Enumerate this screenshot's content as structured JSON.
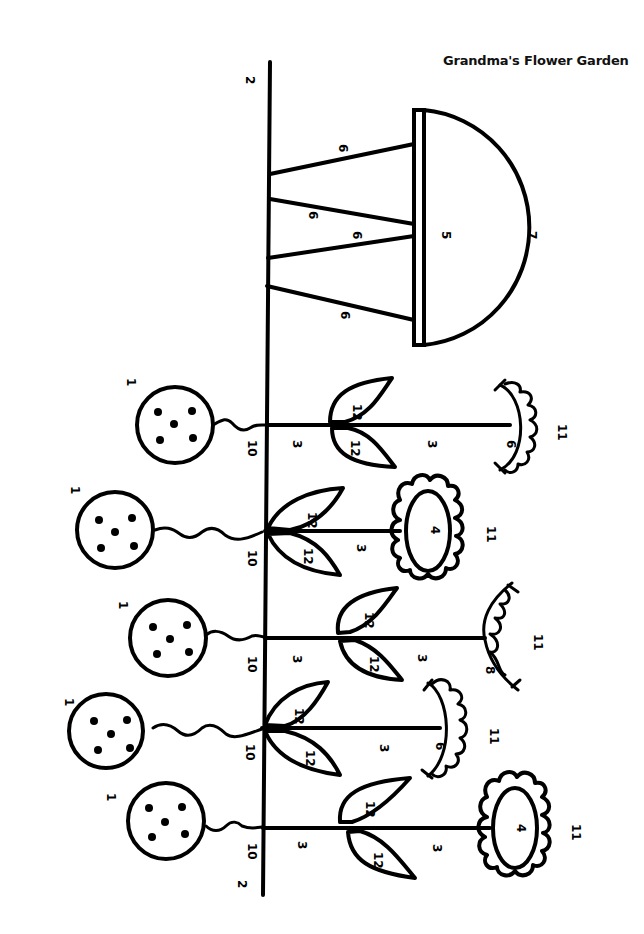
{
  "title": "Grandma's Flower Garden",
  "colors": {
    "ink": "#000000",
    "paper": "#ffffff"
  },
  "fence": {
    "top_label": "2",
    "bottom_label": "2"
  },
  "table": {
    "top_label": "5",
    "dome_label": "7",
    "legs": [
      "6",
      "6",
      "6",
      "6"
    ]
  },
  "flowers": [
    {
      "balloon": "1",
      "string": "10",
      "stem_upper": "3",
      "leaf_top": "12",
      "leaf_bottom": "12",
      "stem_lower": "3",
      "head_inner": "6",
      "head_outer": "11",
      "head_type": "scallop-arc"
    },
    {
      "balloon": "1",
      "string": "10",
      "leaf_top": "12",
      "leaf_bottom": "12",
      "stem_lower": "3",
      "head_inner": "4",
      "head_outer": "11",
      "head_type": "oval-daisy"
    },
    {
      "balloon": "1",
      "string": "10",
      "stem_upper": "3",
      "leaf_top": "12",
      "leaf_bottom": "12",
      "stem_lower": "3",
      "head_inner": "8",
      "head_outer": "11",
      "head_type": "wavy-arc"
    },
    {
      "balloon": "1",
      "string": "10",
      "leaf_top": "12",
      "leaf_bottom": "12",
      "stem_lower": "3",
      "head_inner": "6",
      "head_outer": "11",
      "head_type": "scallop-arc"
    },
    {
      "balloon": "1",
      "string": "10",
      "stem_upper": "3",
      "leaf_top": "12",
      "leaf_bottom": "12",
      "stem_lower": "3",
      "head_inner": "4",
      "head_outer": "11",
      "head_type": "oval-daisy"
    }
  ]
}
